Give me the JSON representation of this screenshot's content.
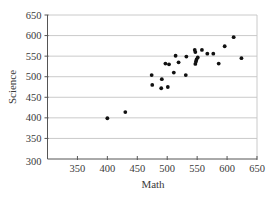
{
  "chart_data": {
    "type": "scatter",
    "title": "",
    "xlabel": "Math",
    "ylabel": "Science",
    "xlim": [
      300,
      650
    ],
    "ylim": [
      300,
      650
    ],
    "xticks": [
      350,
      400,
      450,
      500,
      550,
      600,
      650
    ],
    "yticks": [
      300,
      350,
      400,
      450,
      500,
      550,
      600,
      650
    ],
    "grid": "horizontal",
    "legend": null,
    "series": [
      {
        "name": "Math vs Science",
        "points": [
          {
            "x": 400,
            "y": 399
          },
          {
            "x": 430,
            "y": 414
          },
          {
            "x": 474,
            "y": 504
          },
          {
            "x": 475,
            "y": 480
          },
          {
            "x": 490,
            "y": 472
          },
          {
            "x": 491,
            "y": 494
          },
          {
            "x": 497,
            "y": 532
          },
          {
            "x": 501,
            "y": 475
          },
          {
            "x": 503,
            "y": 530
          },
          {
            "x": 511,
            "y": 510
          },
          {
            "x": 514,
            "y": 551
          },
          {
            "x": 519,
            "y": 535
          },
          {
            "x": 531,
            "y": 504
          },
          {
            "x": 532,
            "y": 549
          },
          {
            "x": 546,
            "y": 565
          },
          {
            "x": 547,
            "y": 560
          },
          {
            "x": 547,
            "y": 531
          },
          {
            "x": 548,
            "y": 537
          },
          {
            "x": 549,
            "y": 542
          },
          {
            "x": 551,
            "y": 547
          },
          {
            "x": 558,
            "y": 565
          },
          {
            "x": 567,
            "y": 556
          },
          {
            "x": 577,
            "y": 556
          },
          {
            "x": 586,
            "y": 532
          },
          {
            "x": 596,
            "y": 574
          },
          {
            "x": 611,
            "y": 596
          },
          {
            "x": 624,
            "y": 545
          }
        ]
      }
    ]
  }
}
